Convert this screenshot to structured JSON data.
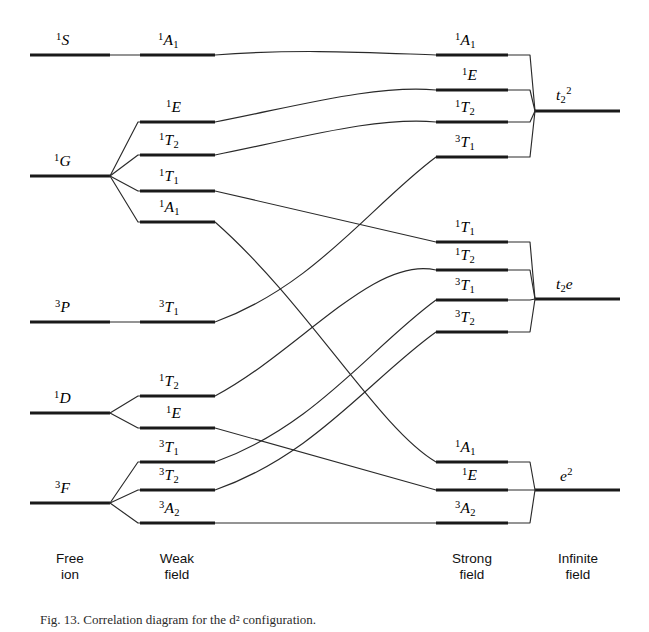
{
  "figure": {
    "kind": "correlation-diagram",
    "caption": "Fig. 13.  Correlation diagram for the d² configuration."
  },
  "columns": [
    {
      "id": "free-ion",
      "line1": "Free",
      "line2": "ion",
      "cx": 70
    },
    {
      "id": "weak-field",
      "line1": "Weak",
      "line2": "field",
      "cx": 177
    },
    {
      "id": "strong-field",
      "line1": "Strong",
      "line2": "field",
      "cx": 472
    },
    {
      "id": "infinite-field",
      "line1": "Infinite",
      "line2": "field",
      "cx": 578
    }
  ],
  "geometry": {
    "free": {
      "x1": 30,
      "x2": 110
    },
    "weak": {
      "x1": 140,
      "x2": 215
    },
    "strong": {
      "x1": 436,
      "x2": 508
    },
    "infinite": {
      "x1": 535,
      "x2": 620
    }
  },
  "free_ion_terms": [
    {
      "id": "1S",
      "pre": "1",
      "main": "S",
      "sub": "",
      "y": 55,
      "label_x": 56,
      "label_y": 32
    },
    {
      "id": "1G",
      "pre": "1",
      "main": "G",
      "sub": "",
      "y": 176,
      "label_x": 54,
      "label_y": 153
    },
    {
      "id": "3P",
      "pre": "3",
      "main": "P",
      "sub": "",
      "y": 322,
      "label_x": 55,
      "label_y": 299
    },
    {
      "id": "1D",
      "pre": "1",
      "main": "D",
      "sub": "",
      "y": 413,
      "label_x": 54,
      "label_y": 390
    },
    {
      "id": "3F",
      "pre": "3",
      "main": "F",
      "sub": "",
      "y": 503,
      "label_x": 55,
      "label_y": 480
    }
  ],
  "weak_field_terms": [
    {
      "id": "w-1A1",
      "pre": "1",
      "main": "A",
      "sub": "1",
      "y": 55,
      "label_x": 158,
      "label_y": 32,
      "parent": "1S"
    },
    {
      "id": "w-1E",
      "pre": "1",
      "main": "E",
      "sub": "",
      "y": 122,
      "label_x": 166,
      "label_y": 99,
      "parent": "1G"
    },
    {
      "id": "w-1T2",
      "pre": "1",
      "main": "T",
      "sub": "2",
      "y": 155,
      "label_x": 159,
      "label_y": 132,
      "parent": "1G"
    },
    {
      "id": "w-1T1",
      "pre": "1",
      "main": "T",
      "sub": "1",
      "y": 191,
      "label_x": 159,
      "label_y": 168,
      "parent": "1G"
    },
    {
      "id": "w-1A1b",
      "pre": "1",
      "main": "A",
      "sub": "1",
      "y": 222,
      "label_x": 159,
      "label_y": 199,
      "parent": "1G"
    },
    {
      "id": "w-3T1",
      "pre": "3",
      "main": "T",
      "sub": "1",
      "y": 322,
      "label_x": 159,
      "label_y": 299,
      "parent": "3P"
    },
    {
      "id": "w-1T2b",
      "pre": "1",
      "main": "T",
      "sub": "2",
      "y": 396,
      "label_x": 159,
      "label_y": 373,
      "parent": "1D"
    },
    {
      "id": "w-1Eb",
      "pre": "1",
      "main": "E",
      "sub": "",
      "y": 428,
      "label_x": 166,
      "label_y": 405,
      "parent": "1D"
    },
    {
      "id": "w-3T1b",
      "pre": "3",
      "main": "T",
      "sub": "1",
      "y": 462,
      "label_x": 159,
      "label_y": 439,
      "parent": "3F"
    },
    {
      "id": "w-3T2",
      "pre": "3",
      "main": "T",
      "sub": "2",
      "y": 490,
      "label_x": 159,
      "label_y": 467,
      "parent": "3F"
    },
    {
      "id": "w-3A2",
      "pre": "3",
      "main": "A",
      "sub": "2",
      "y": 523,
      "label_x": 159,
      "label_y": 500,
      "parent": "3F"
    }
  ],
  "strong_field_terms": [
    {
      "id": "s-1A1",
      "pre": "1",
      "main": "A",
      "sub": "1",
      "y": 55,
      "label_x": 455,
      "label_y": 32,
      "group": "t2-2"
    },
    {
      "id": "s-1E",
      "pre": "1",
      "main": "E",
      "sub": "",
      "y": 90,
      "label_x": 462,
      "label_y": 67,
      "group": "t2-2"
    },
    {
      "id": "s-1T2",
      "pre": "1",
      "main": "T",
      "sub": "2",
      "y": 122,
      "label_x": 455,
      "label_y": 99,
      "group": "t2-2"
    },
    {
      "id": "s-3T1",
      "pre": "3",
      "main": "T",
      "sub": "1",
      "y": 157,
      "label_x": 455,
      "label_y": 134,
      "group": "t2-2"
    },
    {
      "id": "s-1T1",
      "pre": "1",
      "main": "T",
      "sub": "1",
      "y": 242,
      "label_x": 455,
      "label_y": 219,
      "group": "t2e"
    },
    {
      "id": "s-1T2b",
      "pre": "1",
      "main": "T",
      "sub": "2",
      "y": 270,
      "label_x": 455,
      "label_y": 247,
      "group": "t2e"
    },
    {
      "id": "s-3T1b",
      "pre": "3",
      "main": "T",
      "sub": "1",
      "y": 300,
      "label_x": 455,
      "label_y": 277,
      "group": "t2e"
    },
    {
      "id": "s-3T2",
      "pre": "3",
      "main": "T",
      "sub": "2",
      "y": 332,
      "label_x": 455,
      "label_y": 309,
      "group": "t2e"
    },
    {
      "id": "s-1A1b",
      "pre": "1",
      "main": "A",
      "sub": "1",
      "y": 462,
      "label_x": 455,
      "label_y": 439,
      "group": "e2"
    },
    {
      "id": "s-1Eb",
      "pre": "1",
      "main": "E",
      "sub": "",
      "y": 490,
      "label_x": 462,
      "label_y": 467,
      "group": "e2"
    },
    {
      "id": "s-3A2",
      "pre": "3",
      "main": "A",
      "sub": "2",
      "y": 523,
      "label_x": 455,
      "label_y": 500,
      "group": "e2"
    }
  ],
  "infinite_field_terms": [
    {
      "id": "t2-2",
      "main": "t",
      "sub": "2",
      "sup": "2",
      "y": 111,
      "label_x": 556,
      "label_y": 86
    },
    {
      "id": "t2e",
      "main": "t",
      "sub": "2",
      "sup": "",
      "tail": "e",
      "y": 299,
      "label_x": 556,
      "label_y": 276
    },
    {
      "id": "e2",
      "main": "e",
      "sub": "",
      "sup": "2",
      "y": 490,
      "label_x": 560,
      "label_y": 467
    }
  ],
  "correlations": [
    {
      "from": "w-1A1",
      "to": "s-1A1",
      "curve": "arc-up"
    },
    {
      "from": "w-1E",
      "to": "s-1E",
      "curve": "arc-up"
    },
    {
      "from": "w-1T2",
      "to": "s-1T2",
      "curve": "arc-up"
    },
    {
      "from": "w-1T1",
      "to": "s-1T1",
      "curve": "straight"
    },
    {
      "from": "w-1A1b",
      "to": "s-1A1b",
      "curve": "cross-down"
    },
    {
      "from": "w-3T1",
      "to": "s-3T1",
      "curve": "cross-up"
    },
    {
      "from": "w-1T2b",
      "to": "s-1T2b",
      "curve": "arc-up"
    },
    {
      "from": "w-1Eb",
      "to": "s-1Eb",
      "curve": "straight"
    },
    {
      "from": "w-3T1b",
      "to": "s-3T1b",
      "curve": "cross-up"
    },
    {
      "from": "w-3T2",
      "to": "s-3T2",
      "curve": "cross-up"
    },
    {
      "from": "w-3A2",
      "to": "s-3A2",
      "curve": "straight"
    }
  ]
}
